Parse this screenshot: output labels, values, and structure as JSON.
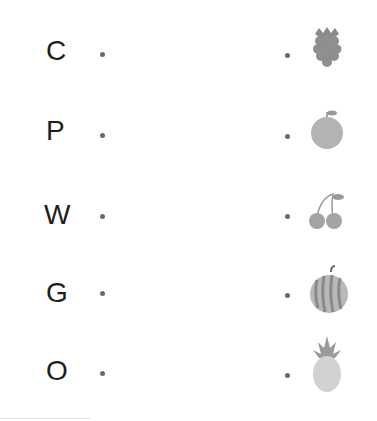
{
  "worksheet": {
    "rows": [
      {
        "letter": "C",
        "fruit": "raspberry"
      },
      {
        "letter": "P",
        "fruit": "orange"
      },
      {
        "letter": "W",
        "fruit": "cherries"
      },
      {
        "letter": "G",
        "fruit": "watermelon"
      },
      {
        "letter": "O",
        "fruit": "pineapple"
      }
    ]
  },
  "colors": {
    "letter": "#1e1e1e",
    "dot": "#6a6a6a",
    "fruit_dark": "#8a8a8a",
    "fruit_mid": "#a8a8a8",
    "fruit_light": "#cfcfcf"
  }
}
